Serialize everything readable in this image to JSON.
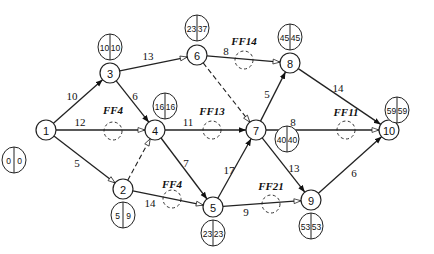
{
  "diagram": {
    "type": "activity-on-arrow network (CPM)",
    "nodes": [
      {
        "id": "1",
        "x": 46,
        "y": 130,
        "es": "0",
        "lf": "0",
        "bx": 14,
        "by": 160
      },
      {
        "id": "2",
        "x": 123,
        "y": 189,
        "es": "5",
        "lf": "9",
        "bx": 123,
        "by": 215
      },
      {
        "id": "3",
        "x": 110,
        "y": 73,
        "es": "10",
        "lf": "10",
        "bx": 110,
        "by": 47
      },
      {
        "id": "4",
        "x": 155,
        "y": 130,
        "es": "16",
        "lf": "16",
        "bx": 165,
        "by": 106
      },
      {
        "id": "5",
        "x": 213,
        "y": 207,
        "es": "23",
        "lf": "23",
        "bx": 213,
        "by": 233
      },
      {
        "id": "6",
        "x": 197,
        "y": 55,
        "es": "23",
        "lf": "37",
        "bx": 197,
        "by": 28
      },
      {
        "id": "7",
        "x": 256,
        "y": 130,
        "es": "40",
        "lf": "40",
        "bx": 287,
        "by": 139
      },
      {
        "id": "8",
        "x": 290,
        "y": 63,
        "es": "45",
        "lf": "45",
        "bx": 290,
        "by": 37
      },
      {
        "id": "9",
        "x": 311,
        "y": 200,
        "es": "53",
        "lf": "53",
        "bx": 311,
        "by": 226
      },
      {
        "id": "10",
        "x": 389,
        "y": 130,
        "es": "59",
        "lf": "59",
        "bx": 397,
        "by": 110
      }
    ],
    "edges": [
      {
        "from": "1",
        "to": "3",
        "duration": "10",
        "critical": true,
        "lx": 72,
        "ly": 96
      },
      {
        "from": "1",
        "to": "4",
        "duration": "12",
        "critical": false,
        "lx": 80,
        "ly": 122
      },
      {
        "from": "1",
        "to": "2",
        "duration": "5",
        "critical": false,
        "lx": 77,
        "ly": 163
      },
      {
        "from": "3",
        "to": "6",
        "duration": "13",
        "critical": false,
        "lx": 148,
        "ly": 56
      },
      {
        "from": "3",
        "to": "4",
        "duration": "6",
        "critical": true,
        "lx": 135,
        "ly": 96
      },
      {
        "from": "4",
        "to": "7",
        "duration": "11",
        "critical": true,
        "lx": 188,
        "ly": 122
      },
      {
        "from": "4",
        "to": "5",
        "duration": "7",
        "critical": true,
        "lx": 186,
        "ly": 163
      },
      {
        "from": "2",
        "to": "5",
        "duration": "14",
        "critical": false,
        "lx": 150,
        "ly": 203
      },
      {
        "from": "5",
        "to": "7",
        "duration": "17",
        "critical": true,
        "lx": 229,
        "ly": 170
      },
      {
        "from": "5",
        "to": "9",
        "duration": "9",
        "critical": false,
        "lx": 246,
        "ly": 212
      },
      {
        "from": "6",
        "to": "8",
        "duration": "8",
        "critical": false,
        "lx": 226,
        "ly": 51
      },
      {
        "from": "7",
        "to": "8",
        "duration": "5",
        "critical": true,
        "lx": 267,
        "ly": 94
      },
      {
        "from": "7",
        "to": "10",
        "duration": "8",
        "critical": false,
        "lx": 293,
        "ly": 122
      },
      {
        "from": "7",
        "to": "9",
        "duration": "13",
        "critical": true,
        "lx": 294,
        "ly": 168
      },
      {
        "from": "8",
        "to": "10",
        "duration": "14",
        "critical": true,
        "lx": 338,
        "ly": 88
      },
      {
        "from": "9",
        "to": "10",
        "duration": "6",
        "critical": true,
        "lx": 354,
        "ly": 173
      }
    ],
    "dummies": [
      {
        "from": "2",
        "to": "4"
      },
      {
        "from": "6",
        "to": "7"
      }
    ],
    "free_floats": [
      {
        "label": "FF4",
        "x": 113,
        "y": 131,
        "tx": 113,
        "ty": 114
      },
      {
        "label": "FF13",
        "x": 212,
        "y": 130,
        "tx": 212,
        "ty": 115
      },
      {
        "label": "FF14",
        "x": 244,
        "y": 60,
        "tx": 244,
        "ty": 45
      },
      {
        "label": "FF11",
        "x": 346,
        "y": 130,
        "tx": 346,
        "ty": 116
      },
      {
        "label": "FF4",
        "x": 172,
        "y": 199,
        "tx": 172,
        "ty": 188
      },
      {
        "label": "FF21",
        "x": 271,
        "y": 204,
        "tx": 271,
        "ty": 190
      }
    ]
  }
}
